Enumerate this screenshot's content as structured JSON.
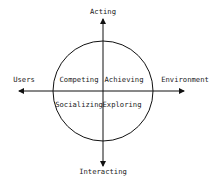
{
  "diagram": {
    "axes": {
      "top": "Acting",
      "bottom": "Interacting",
      "left": "Users",
      "right": "Environment"
    },
    "quadrants": {
      "top_left": "Competing",
      "top_right": "Achieving",
      "bottom_left": "Socializing",
      "bottom_right": "Exploring"
    },
    "colors": {
      "stroke": "#111111",
      "text": "#222222",
      "background": "#ffffff"
    }
  }
}
